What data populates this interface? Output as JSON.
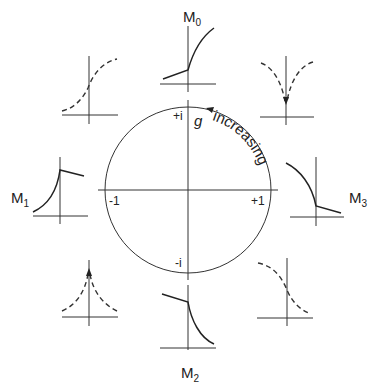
{
  "diagram": {
    "type": "phase-circle-with-response-sketches",
    "circle": {
      "axis_labels": {
        "positive_real": "+1",
        "negative_real": "-1",
        "positive_imag": "+i",
        "negative_imag": "-i"
      },
      "parameter_symbol": "g",
      "direction_label": "increasing",
      "direction": "counter-clockwise"
    },
    "sketches": [
      {
        "id": "M0",
        "label": "M",
        "subscript": "0",
        "position": "top",
        "style": "solid",
        "shape": "kink-then-rising-concave"
      },
      {
        "id": "top-right",
        "label": "",
        "position": "top-right",
        "style": "dashed",
        "shape": "cusp-down"
      },
      {
        "id": "M3",
        "label": "M",
        "subscript": "3",
        "position": "right",
        "style": "solid",
        "shape": "falling-then-kink"
      },
      {
        "id": "bottom-right",
        "label": "",
        "position": "bottom-right",
        "style": "dashed",
        "shape": "falling-sigmoid"
      },
      {
        "id": "M2",
        "label": "M",
        "subscript": "2",
        "position": "bottom",
        "style": "solid",
        "shape": "kink-then-falling-convex"
      },
      {
        "id": "bottom-left",
        "label": "",
        "position": "bottom-left",
        "style": "dashed",
        "shape": "cusp-up"
      },
      {
        "id": "M1",
        "label": "M",
        "subscript": "1",
        "position": "left",
        "style": "solid",
        "shape": "rising-then-kink"
      },
      {
        "id": "top-left",
        "label": "",
        "position": "top-left",
        "style": "dashed",
        "shape": "rising-sigmoid"
      }
    ]
  }
}
